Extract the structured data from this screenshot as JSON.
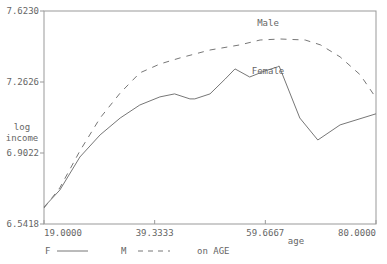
{
  "chart_data": {
    "type": "line",
    "title": "",
    "xlabel": "age",
    "ylabel": [
      "log",
      "income"
    ],
    "xlim": [
      19.0,
      80.0
    ],
    "ylim": [
      6.5418,
      7.623
    ],
    "x_ticks": [
      {
        "value": 19.0,
        "label": "19.0000"
      },
      {
        "value": 39.3333,
        "label": "39.3333"
      },
      {
        "value": 59.6667,
        "label": "59.6667"
      },
      {
        "value": 80.0,
        "label": "80.0000"
      }
    ],
    "y_ticks": [
      {
        "value": 6.5418,
        "label": "6.5418"
      },
      {
        "value": 6.9022,
        "label": "6.9022"
      },
      {
        "value": 7.2626,
        "label": "7.2626"
      },
      {
        "value": 7.623,
        "label": "7.6230"
      }
    ],
    "grid": false,
    "series": [
      {
        "name": "Female",
        "key": "F",
        "style": "solid",
        "x": [
          19.0,
          21.9,
          25.6,
          29.3,
          33.0,
          36.6,
          40.3,
          43.0,
          45.8,
          46.7,
          49.5,
          52.3,
          54.1,
          56.8,
          59.6,
          61.9,
          62.2,
          66.0,
          69.3,
          73.4,
          80.0
        ],
        "y": [
          6.628,
          6.714,
          6.882,
          6.994,
          7.08,
          7.146,
          7.187,
          7.202,
          7.177,
          7.177,
          7.202,
          7.278,
          7.329,
          7.288,
          7.319,
          7.339,
          7.344,
          7.08,
          6.968,
          7.045,
          7.101
        ]
      },
      {
        "name": "Male",
        "key": "M",
        "style": "dashed",
        "x": [
          19.0,
          21.9,
          25.6,
          29.3,
          33.0,
          36.6,
          40.3,
          44.0,
          49.5,
          55.0,
          58.7,
          62.4,
          67.0,
          69.8,
          73.4,
          77.1,
          80.0
        ],
        "y": [
          6.623,
          6.725,
          6.913,
          7.08,
          7.207,
          7.309,
          7.354,
          7.385,
          7.425,
          7.451,
          7.476,
          7.481,
          7.476,
          7.451,
          7.39,
          7.299,
          7.182
        ]
      }
    ],
    "annotations": [
      {
        "text": "Male",
        "series": "Male"
      },
      {
        "text": "Female",
        "series": "Female"
      }
    ],
    "legend": {
      "placement": "bottom-left",
      "items": [
        {
          "key": "F",
          "style": "solid"
        },
        {
          "key": "M",
          "style": "dashed"
        }
      ],
      "suffix": "on AGE"
    }
  }
}
